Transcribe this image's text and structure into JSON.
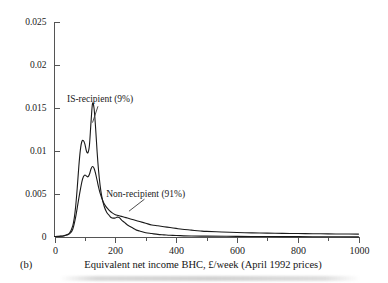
{
  "figure": {
    "panel_tag": "(b)",
    "xlabel": "Equivalent net income BHC, £/week (April 1992 prices)"
  },
  "chart_data": {
    "type": "line",
    "title": "",
    "subtitle": "",
    "panel": "(b)",
    "xlabel": "Equivalent net income BHC, £/week (April 1992 prices)",
    "ylabel": "",
    "xlim": [
      0,
      1000
    ],
    "ylim": [
      0,
      0.025
    ],
    "grid": false,
    "legend_position": "inline-annotations",
    "x_ticks_major": [
      0,
      200,
      400,
      600,
      800,
      1000
    ],
    "x_tick_labels": [
      "0",
      "200",
      "400",
      "600",
      "800",
      "1000"
    ],
    "x_ticks_minor": [
      100,
      300,
      500,
      700,
      900
    ],
    "y_ticks": [
      0,
      0.005,
      0.01,
      0.015,
      0.02,
      0.025
    ],
    "y_tick_labels": [
      "0",
      "0.005",
      "0.01",
      "0.015",
      "0.02",
      "0.025"
    ],
    "annotations": [
      {
        "name": "is-recipient-annotation",
        "text": "IS-recipient (9%)",
        "text_x": 150,
        "text_y": 0.0157,
        "leader_from_x": 125,
        "leader_from_y": 0.0133,
        "leader_to_x": 143,
        "leader_to_y": 0.0152
      },
      {
        "name": "non-recipient-annotation",
        "text": "Non-recipient (91%)",
        "text_x": 300,
        "text_y": 0.0046,
        "leader_from_x": 245,
        "leader_from_y": 0.003,
        "leader_to_x": 296,
        "leader_to_y": 0.0044
      }
    ],
    "series": [
      {
        "name": "IS-recipient (9%)",
        "share_percent": 9,
        "color": "#1a1a1a",
        "x": [
          0,
          10,
          20,
          30,
          40,
          50,
          60,
          65,
          70,
          75,
          80,
          85,
          90,
          95,
          100,
          105,
          110,
          115,
          120,
          125,
          130,
          135,
          140,
          145,
          150,
          155,
          160,
          165,
          170,
          175,
          180,
          185,
          190,
          195,
          200,
          205,
          210,
          215,
          220,
          230,
          240,
          250,
          260,
          270,
          280,
          300,
          320,
          340,
          360,
          380,
          400,
          450,
          500,
          600,
          700,
          800,
          900,
          1000
        ],
        "y": [
          5e-05,
          7e-05,
          0.0001,
          0.00015,
          0.00025,
          0.0005,
          0.0013,
          0.0022,
          0.0037,
          0.0058,
          0.0082,
          0.0101,
          0.0111,
          0.0112,
          0.0108,
          0.01,
          0.0098,
          0.0107,
          0.0133,
          0.0155,
          0.015,
          0.0128,
          0.01,
          0.0077,
          0.006,
          0.0048,
          0.004,
          0.0034,
          0.003,
          0.0027,
          0.0025,
          0.0023,
          0.0022,
          0.0022,
          0.0022,
          0.0023,
          0.0023,
          0.0022,
          0.002,
          0.0017,
          0.0014,
          0.0012,
          0.001,
          0.0008,
          0.0007,
          0.0005,
          0.0004,
          0.0003,
          0.00025,
          0.0002,
          0.00018,
          0.00012,
          0.0001,
          7e-05,
          5e-05,
          4e-05,
          3e-05,
          2e-05
        ]
      },
      {
        "name": "Non-recipient (91%)",
        "share_percent": 91,
        "color": "#1a1a1a",
        "x": [
          0,
          10,
          20,
          30,
          40,
          50,
          60,
          70,
          80,
          90,
          95,
          100,
          105,
          110,
          115,
          120,
          125,
          130,
          135,
          140,
          145,
          150,
          160,
          170,
          180,
          190,
          200,
          210,
          220,
          230,
          240,
          250,
          260,
          280,
          300,
          320,
          340,
          360,
          380,
          400,
          420,
          450,
          480,
          500,
          550,
          600,
          650,
          700,
          750,
          800,
          850,
          900,
          950,
          1000
        ],
        "y": [
          5e-05,
          6e-05,
          8e-05,
          0.00012,
          0.00022,
          0.0004,
          0.0009,
          0.0024,
          0.0045,
          0.0064,
          0.007,
          0.0072,
          0.0071,
          0.007,
          0.0073,
          0.0079,
          0.0082,
          0.008,
          0.0074,
          0.0066,
          0.0058,
          0.0051,
          0.0041,
          0.0035,
          0.0031,
          0.0028,
          0.0026,
          0.0025,
          0.0024,
          0.0023,
          0.0022,
          0.0021,
          0.002,
          0.0018,
          0.0016,
          0.0014,
          0.0013,
          0.0012,
          0.0011,
          0.001,
          0.0009,
          0.0008,
          0.0007,
          0.00065,
          0.00058,
          0.00052,
          0.00048,
          0.00045,
          0.00042,
          0.0004,
          0.00038,
          0.00036,
          0.00035,
          0.00034
        ]
      }
    ]
  }
}
